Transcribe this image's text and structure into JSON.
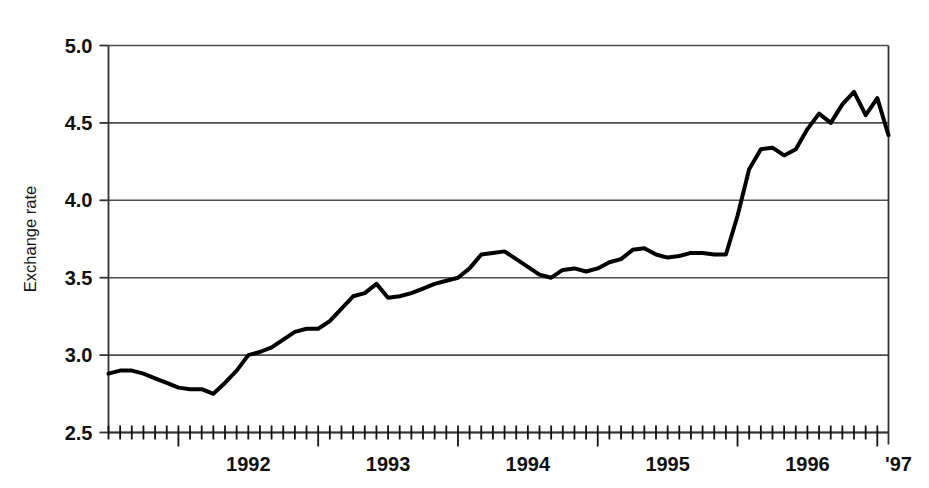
{
  "chart_data": {
    "type": "line",
    "title": "",
    "subtitle": "",
    "xlabel": "",
    "ylabel": "Exchange rate",
    "ylim": [
      2.5,
      5.0
    ],
    "ytick_labels": [
      "5.0",
      "4.5",
      "4.0",
      "3.5",
      "3.0",
      "2.5"
    ],
    "ytick_values": [
      5.0,
      4.5,
      4.0,
      3.5,
      3.0,
      2.5
    ],
    "xtick_labels": [
      "1992",
      "1993",
      "1994",
      "1995",
      "1996",
      "'97"
    ],
    "xtick_values": [
      1992,
      1993,
      1994,
      1995,
      1996,
      1997
    ],
    "x_minor_tick_interval": "month",
    "xlim": [
      1991.5,
      1997.08
    ],
    "grid": "horizontal",
    "legend": "none",
    "line_color": "#000000",
    "line_width": 4,
    "grid_color": "#4d4d4d",
    "axis_color": "#333333",
    "x": [
      1991.5,
      1991.583,
      1991.667,
      1991.75,
      1991.833,
      1991.917,
      1992.0,
      1992.083,
      1992.167,
      1992.25,
      1992.333,
      1992.417,
      1992.5,
      1992.583,
      1992.667,
      1992.75,
      1992.833,
      1992.917,
      1993.0,
      1993.083,
      1993.167,
      1993.25,
      1993.333,
      1993.417,
      1993.5,
      1993.583,
      1993.667,
      1993.75,
      1993.833,
      1993.917,
      1994.0,
      1994.083,
      1994.167,
      1994.25,
      1994.333,
      1994.417,
      1994.5,
      1994.583,
      1994.667,
      1994.75,
      1994.833,
      1994.917,
      1995.0,
      1995.083,
      1995.167,
      1995.25,
      1995.333,
      1995.417,
      1995.5,
      1995.583,
      1995.667,
      1995.75,
      1995.833,
      1995.917,
      1996.0,
      1996.083,
      1996.167,
      1996.25,
      1996.333,
      1996.417,
      1996.5,
      1996.583,
      1996.667,
      1996.75,
      1996.833,
      1996.917,
      1997.0,
      1997.08
    ],
    "values": [
      2.88,
      2.9,
      2.9,
      2.88,
      2.85,
      2.82,
      2.79,
      2.78,
      2.78,
      2.75,
      2.82,
      2.9,
      3.0,
      3.02,
      3.05,
      3.1,
      3.15,
      3.17,
      3.17,
      3.22,
      3.3,
      3.38,
      3.4,
      3.46,
      3.37,
      3.38,
      3.4,
      3.43,
      3.46,
      3.48,
      3.5,
      3.56,
      3.65,
      3.66,
      3.67,
      3.62,
      3.57,
      3.52,
      3.5,
      3.55,
      3.56,
      3.54,
      3.56,
      3.6,
      3.62,
      3.68,
      3.69,
      3.65,
      3.63,
      3.64,
      3.66,
      3.66,
      3.65,
      3.65,
      3.9,
      4.2,
      4.33,
      4.34,
      4.29,
      4.33,
      4.46,
      4.56,
      4.5,
      4.62,
      4.7,
      4.55,
      4.66,
      4.42
    ],
    "annotations": []
  }
}
